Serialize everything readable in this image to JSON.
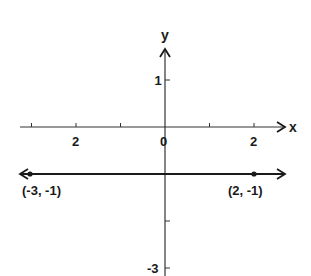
{
  "chart_data": {
    "type": "line",
    "title": "",
    "xlabel": "x",
    "ylabel": "y",
    "grid": false,
    "legend": null,
    "xlim": [
      -3.3,
      2.6
    ],
    "ylim": [
      -3.2,
      1.9
    ],
    "x_ticks": [
      -3,
      -2,
      -1,
      0,
      1,
      2
    ],
    "x_tick_labels": [
      {
        "value": -2,
        "text": "2"
      },
      {
        "value": 0,
        "text": "0"
      },
      {
        "value": 2,
        "text": "2"
      }
    ],
    "y_ticks": [
      1,
      -2,
      -3
    ],
    "y_tick_labels": [
      {
        "value": 1,
        "text": "1"
      },
      {
        "value": -3,
        "text": "-3"
      }
    ],
    "series": [
      {
        "name": "y = -1",
        "kind": "horizontal-line",
        "y": -1,
        "arrows": "both",
        "points": [
          {
            "x": -3,
            "y": -1,
            "label": "(-3, -1)"
          },
          {
            "x": 2,
            "y": -1,
            "label": "(2, -1)"
          }
        ]
      }
    ],
    "annotations": [
      "(-3, -1)",
      "(2, -1)"
    ]
  },
  "colors": {
    "ink": "#1a1a1a",
    "axis": "#333333",
    "background": "#ffffff"
  }
}
